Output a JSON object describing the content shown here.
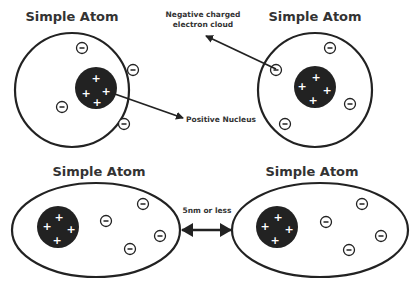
{
  "diagram": {
    "atoms": [
      {
        "id": "top-left",
        "title": "Simple Atom",
        "shape": "circle",
        "cx": 72,
        "cy": 90,
        "rx": 57,
        "ry": 57,
        "title_pos": [
          72,
          21
        ],
        "nucleus": {
          "cx": 96,
          "cy": 88,
          "r": 21,
          "charges": [
            [
              96,
              78
            ],
            [
              86,
              93
            ],
            [
              106,
              91
            ],
            [
              97,
              102
            ]
          ]
        },
        "electrons": [
          [
            82,
            48
          ],
          [
            133,
            70
          ],
          [
            62,
            107
          ],
          [
            124,
            124
          ]
        ]
      },
      {
        "id": "top-right",
        "title": "Simple Atom",
        "shape": "circle",
        "cx": 315,
        "cy": 90,
        "rx": 57,
        "ry": 57,
        "title_pos": [
          315,
          21
        ],
        "nucleus": {
          "cx": 315,
          "cy": 87,
          "r": 21,
          "charges": [
            [
              316,
              77
            ],
            [
              302,
              86
            ],
            [
              327,
              90
            ],
            [
              313,
              100
            ]
          ]
        },
        "electrons": [
          [
            330,
            48
          ],
          [
            276,
            70
          ],
          [
            350,
            104
          ],
          [
            285,
            124
          ]
        ]
      },
      {
        "id": "bottom-left",
        "title": "Simple Atom",
        "shape": "ellipse",
        "cx": 96,
        "cy": 230,
        "rx": 84,
        "ry": 47,
        "title_pos": [
          99,
          176
        ],
        "nucleus": {
          "cx": 58,
          "cy": 227,
          "r": 21,
          "charges": [
            [
              59,
              217
            ],
            [
              47,
              226
            ],
            [
              71,
              229
            ],
            [
              57,
              240
            ]
          ]
        },
        "electrons": [
          [
            106,
            221
          ],
          [
            143,
            204
          ],
          [
            160,
            236
          ],
          [
            130,
            249
          ]
        ]
      },
      {
        "id": "bottom-right",
        "title": "Simple Atom",
        "shape": "ellipse",
        "cx": 320,
        "cy": 230,
        "rx": 88,
        "ry": 47,
        "title_pos": [
          312,
          176
        ],
        "nucleus": {
          "cx": 277,
          "cy": 227,
          "r": 21,
          "charges": [
            [
              278,
              217
            ],
            [
              265,
              226
            ],
            [
              289,
              229
            ],
            [
              275,
              240
            ]
          ]
        },
        "electrons": [
          [
            326,
            222
          ],
          [
            362,
            204
          ],
          [
            381,
            236
          ],
          [
            349,
            250
          ]
        ]
      }
    ],
    "labels": {
      "electron_cloud_line1": "Negative charged",
      "electron_cloud_line2": "electron cloud",
      "positive_nucleus": "Positive Nucleus",
      "distance": "5nm or less"
    },
    "symbols": {
      "proton": "+",
      "electron": "−"
    },
    "colors": {
      "outline": "#222222",
      "nucleus_fill": "#222222",
      "text": "#333333",
      "background": "#ffffff"
    }
  }
}
